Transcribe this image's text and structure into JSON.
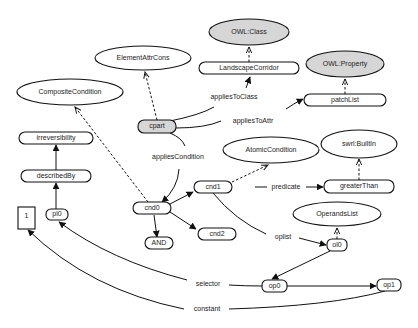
{
  "diagram": {
    "type": "ontology-graph",
    "colors": {
      "class_fill": "#d6d6d6",
      "node_fill": "#ffffff",
      "stroke": "#111111"
    },
    "class_nodes": [
      {
        "id": "composite",
        "label": "CompositeCondition"
      },
      {
        "id": "elemattr",
        "label": "ElementAttrCons"
      },
      {
        "id": "owlclass",
        "label": "OWL:Class"
      },
      {
        "id": "owlprop",
        "label": "OWL:Property"
      },
      {
        "id": "atomic",
        "label": "AtomicCondition"
      },
      {
        "id": "builtin",
        "label": "swrl:BuiltIn"
      },
      {
        "id": "operands",
        "label": "OperandsList"
      }
    ],
    "instance_nodes": [
      {
        "id": "landscape",
        "label": "LandscapeCorridor"
      },
      {
        "id": "patchlist",
        "label": "patchList"
      },
      {
        "id": "cpart",
        "label": "cpart"
      },
      {
        "id": "irrev",
        "label": "irreversibility"
      },
      {
        "id": "describedby",
        "label": "describedBy"
      },
      {
        "id": "cnd1",
        "label": "cnd1"
      },
      {
        "id": "greater",
        "label": "greaterThan"
      },
      {
        "id": "cnd0",
        "label": "cnd0"
      },
      {
        "id": "and",
        "label": "AND"
      },
      {
        "id": "cnd2",
        "label": "cnd2"
      },
      {
        "id": "ol0",
        "label": "ol0"
      },
      {
        "id": "literal1",
        "label": "1"
      },
      {
        "id": "pl0",
        "label": "pl0"
      },
      {
        "id": "op0",
        "label": "op0"
      },
      {
        "id": "op1",
        "label": "op1"
      }
    ],
    "edge_labels": {
      "appliesToClass": "appliesToClass",
      "appliesToAttr": "appliesToAttr",
      "appliesCondition": "appliesCondition",
      "predicate": "predicate",
      "oplist": "oplist",
      "selector": "selector",
      "constant": "constant"
    },
    "edges": [
      {
        "from": "cpart",
        "to": "landscape",
        "label": "appliesToClass",
        "style": "solid"
      },
      {
        "from": "cpart",
        "to": "patchlist",
        "label": "appliesToAttr",
        "style": "solid"
      },
      {
        "from": "cpart",
        "to": "cnd0",
        "label": "appliesCondition",
        "style": "solid"
      },
      {
        "from": "cnd1",
        "to": "greater",
        "label": "predicate",
        "style": "solid"
      },
      {
        "from": "cnd1",
        "to": "ol0",
        "label": "oplist",
        "style": "solid"
      },
      {
        "from": "op0",
        "to": "pl0",
        "label": "selector",
        "style": "solid"
      },
      {
        "from": "op1",
        "to": "literal1",
        "label": "constant",
        "style": "solid"
      },
      {
        "from": "cnd0",
        "to": "cnd1",
        "label": "",
        "style": "solid"
      },
      {
        "from": "cnd0",
        "to": "cnd2",
        "label": "",
        "style": "solid"
      },
      {
        "from": "cnd0",
        "to": "and",
        "label": "",
        "style": "solid"
      },
      {
        "from": "ol0",
        "to": "op0",
        "label": "",
        "style": "solid"
      },
      {
        "from": "op0",
        "to": "op1",
        "label": "",
        "style": "solid"
      },
      {
        "from": "pl0",
        "to": "describedby",
        "label": "",
        "style": "solid"
      },
      {
        "from": "describedby",
        "to": "irrev",
        "label": "",
        "style": "solid"
      },
      {
        "from": "landscape",
        "to": "owlclass",
        "label": "",
        "style": "dashed"
      },
      {
        "from": "patchlist",
        "to": "owlprop",
        "label": "",
        "style": "dashed"
      },
      {
        "from": "cpart",
        "to": "elemattr",
        "label": "",
        "style": "dashed"
      },
      {
        "from": "cnd0",
        "to": "composite",
        "label": "",
        "style": "dashed"
      },
      {
        "from": "cnd1",
        "to": "atomic",
        "label": "",
        "style": "dashed"
      },
      {
        "from": "greater",
        "to": "builtin",
        "label": "",
        "style": "dashed"
      },
      {
        "from": "ol0",
        "to": "operands",
        "label": "",
        "style": "dashed"
      }
    ]
  }
}
